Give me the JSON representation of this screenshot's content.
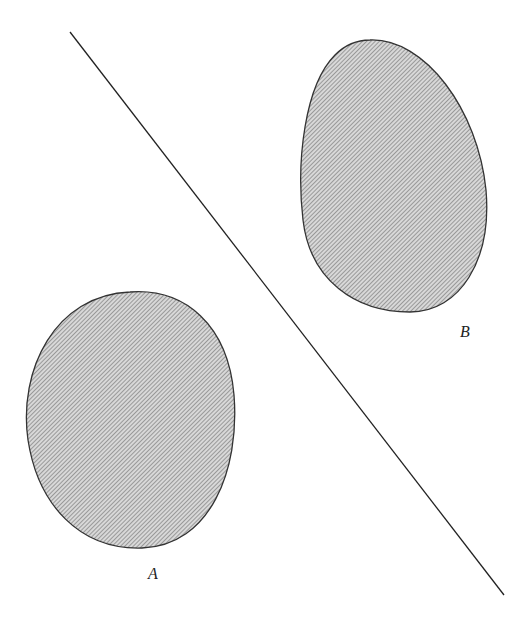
{
  "figure": {
    "type": "separating-line-diagram",
    "regions": [
      {
        "id": "A",
        "label": "A",
        "fill_pattern": "diagonal-hatch"
      },
      {
        "id": "B",
        "label": "B",
        "fill_pattern": "diagonal-hatch"
      }
    ],
    "separator": {
      "kind": "straight-line"
    },
    "colors": {
      "outline": "#333333",
      "hatch": "#6e6e6e",
      "hatch_bg": "#d6d6d6",
      "line": "#222222"
    }
  }
}
